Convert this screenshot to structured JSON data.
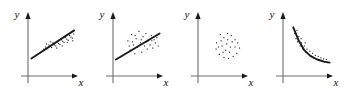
{
  "figure": {
    "title": "",
    "width": 350,
    "height": 92,
    "background": "#ffffff",
    "panel_count": 4
  },
  "style": {
    "axis_color": "#6e6e6e",
    "arrow_color": "#1a1a1a",
    "point_color": "#1a1a1a",
    "fit_color": "#1a1a1a",
    "label_color": "#111111"
  },
  "axis": {
    "x_label": "x",
    "y_label": "y"
  },
  "chart_data": [
    {
      "type": "scatter",
      "title": "",
      "xlabel": "x",
      "ylabel": "y",
      "xlim": [
        0,
        100
      ],
      "ylim": [
        0,
        100
      ],
      "grid": false,
      "legend": "none",
      "relationship": "strong-positive-linear",
      "fit": {
        "type": "line",
        "x": [
          3,
          96
        ],
        "y": [
          26,
          80
        ]
      },
      "points": [
        [
          30,
          44
        ],
        [
          34,
          48
        ],
        [
          38,
          45
        ],
        [
          41,
          52
        ],
        [
          44,
          50
        ],
        [
          47,
          47
        ],
        [
          50,
          56
        ],
        [
          53,
          52
        ],
        [
          56,
          50
        ],
        [
          59,
          58
        ],
        [
          62,
          55
        ],
        [
          65,
          53
        ],
        [
          68,
          62
        ],
        [
          71,
          59
        ],
        [
          74,
          57
        ],
        [
          77,
          66
        ],
        [
          80,
          63
        ],
        [
          83,
          61
        ],
        [
          86,
          70
        ],
        [
          89,
          67
        ],
        [
          92,
          65
        ],
        [
          95,
          73
        ],
        [
          36,
          54
        ],
        [
          58,
          46
        ],
        [
          81,
          57
        ],
        [
          93,
          60
        ],
        [
          45,
          58
        ],
        [
          70,
          50
        ]
      ]
    },
    {
      "type": "scatter",
      "title": "",
      "xlabel": "x",
      "ylabel": "y",
      "xlim": [
        0,
        100
      ],
      "ylim": [
        0,
        100
      ],
      "grid": false,
      "legend": "none",
      "relationship": "weak-positive-linear",
      "fit": {
        "type": "line",
        "x": [
          2,
          97
        ],
        "y": [
          24,
          74
        ]
      },
      "points": [
        [
          28,
          60
        ],
        [
          33,
          42
        ],
        [
          36,
          72
        ],
        [
          40,
          52
        ],
        [
          43,
          35
        ],
        [
          46,
          64
        ],
        [
          49,
          48
        ],
        [
          52,
          78
        ],
        [
          55,
          56
        ],
        [
          58,
          38
        ],
        [
          61,
          68
        ],
        [
          64,
          50
        ],
        [
          67,
          74
        ],
        [
          70,
          44
        ],
        [
          73,
          60
        ],
        [
          76,
          52
        ],
        [
          79,
          70
        ],
        [
          82,
          46
        ],
        [
          85,
          62
        ],
        [
          88,
          56
        ],
        [
          91,
          66
        ],
        [
          31,
          50
        ],
        [
          44,
          70
        ],
        [
          57,
          62
        ],
        [
          69,
          58
        ],
        [
          80,
          60
        ],
        [
          94,
          50
        ],
        [
          38,
          58
        ]
      ]
    },
    {
      "type": "scatter",
      "title": "",
      "xlabel": "x",
      "ylabel": "y",
      "xlim": [
        0,
        100
      ],
      "ylim": [
        0,
        100
      ],
      "grid": false,
      "legend": "none",
      "relationship": "no-correlation",
      "fit": null,
      "points": [
        [
          36,
          56
        ],
        [
          44,
          72
        ],
        [
          52,
          66
        ],
        [
          60,
          74
        ],
        [
          68,
          70
        ],
        [
          76,
          62
        ],
        [
          82,
          56
        ],
        [
          86,
          46
        ],
        [
          80,
          36
        ],
        [
          72,
          30
        ],
        [
          62,
          26
        ],
        [
          52,
          28
        ],
        [
          42,
          34
        ],
        [
          35,
          44
        ],
        [
          48,
          50
        ],
        [
          58,
          54
        ],
        [
          66,
          48
        ],
        [
          56,
          42
        ],
        [
          46,
          60
        ],
        [
          70,
          58
        ],
        [
          40,
          48
        ],
        [
          64,
          38
        ],
        [
          76,
          48
        ],
        [
          50,
          38
        ],
        [
          60,
          62
        ]
      ]
    },
    {
      "type": "scatter",
      "title": "",
      "xlabel": "x",
      "ylabel": "y",
      "xlim": [
        0,
        100
      ],
      "ylim": [
        0,
        100
      ],
      "grid": false,
      "legend": "none",
      "relationship": "negative-nonlinear-decay",
      "fit": {
        "type": "curve",
        "x": [
          18,
          30,
          42,
          55,
          70,
          85,
          97
        ],
        "y": [
          86,
          60,
          42,
          31,
          24,
          20,
          18
        ]
      },
      "points": [
        [
          21,
          74
        ],
        [
          24,
          64
        ],
        [
          27,
          58
        ],
        [
          30,
          68
        ],
        [
          33,
          50
        ],
        [
          36,
          56
        ],
        [
          39,
          44
        ],
        [
          42,
          50
        ],
        [
          45,
          38
        ],
        [
          48,
          44
        ],
        [
          51,
          34
        ],
        [
          54,
          40
        ],
        [
          57,
          30
        ],
        [
          60,
          36
        ],
        [
          63,
          27
        ],
        [
          66,
          32
        ],
        [
          69,
          24
        ],
        [
          72,
          30
        ],
        [
          75,
          22
        ],
        [
          78,
          27
        ],
        [
          81,
          20
        ],
        [
          84,
          25
        ],
        [
          87,
          19
        ],
        [
          90,
          24
        ],
        [
          93,
          18
        ],
        [
          26,
          80
        ],
        [
          35,
          64
        ],
        [
          44,
          56
        ]
      ]
    }
  ]
}
